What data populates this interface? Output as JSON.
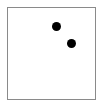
{
  "figure": {
    "title": "",
    "background_color": "#ffffff",
    "width": 104,
    "height": 108
  },
  "frame": {
    "label": "plot frame",
    "x": 7,
    "y": 7,
    "width": 89,
    "height": 93,
    "border_color": "#8a8a8a",
    "border_width": 1,
    "fill_color": "#ffffff"
  },
  "chart_data": {
    "type": "scatter",
    "title": "",
    "xlabel": "",
    "ylabel": "",
    "xlim": [
      0,
      89
    ],
    "ylim": [
      0,
      93
    ],
    "grid": false,
    "legend": false,
    "marker_color": "#000000",
    "marker_shape": "circle",
    "marker_size_px": 9,
    "point_count": 2,
    "points": [
      {
        "name": "point-1",
        "x": 49.5,
        "y": 74,
        "cx_px": 56.5,
        "cy_px": 26,
        "diameter_px": 9,
        "color": "#000000"
      },
      {
        "name": "point-2",
        "x": 64,
        "y": 57,
        "cx_px": 71,
        "cy_px": 43,
        "diameter_px": 9,
        "color": "#000000"
      }
    ]
  },
  "accessibility": {
    "description": "A white rectangle outlined in gray containing two small black filled circles in the upper middle area."
  }
}
